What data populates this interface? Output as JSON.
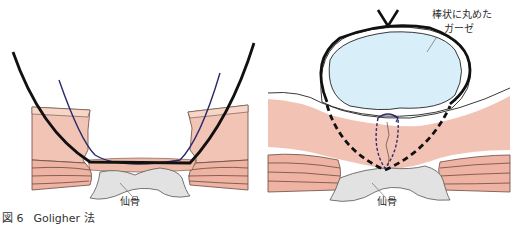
{
  "figure": {
    "caption_number": "図 6",
    "caption_title": "Goligher 法"
  },
  "left_panel": {
    "labels": {
      "bone": "仙骨"
    }
  },
  "right_panel": {
    "labels": {
      "gauze_line1": "棒状に丸めた",
      "gauze_line2": "ガーゼ",
      "bone": "仙骨"
    }
  },
  "colors": {
    "skin": "#f2c2b4",
    "muscle": "#eeb3a2",
    "bone": "#e2e2e2",
    "gauze": "#d8eef8",
    "suture": "#1a1a1a",
    "thread": "#2a2a6a"
  }
}
